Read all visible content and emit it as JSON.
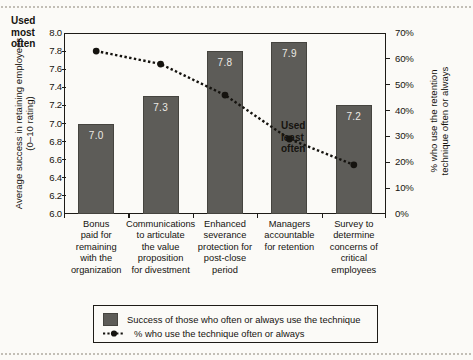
{
  "chart_data": {
    "type": "bar",
    "title": "",
    "subtitle": "",
    "categories": [
      "Bonus paid for remaining with the organization",
      "Communications to articulate the value proposition for divestment",
      "Enhanced severance protection for post-close period",
      "Managers accountable for retention",
      "Survey to determine concerns of critical employees"
    ],
    "category_lines": [
      [
        "Bonus",
        "paid for",
        "remaining",
        "with the",
        "organization"
      ],
      [
        "Communications",
        "to articulate",
        "the value",
        "proposition",
        "for divestment"
      ],
      [
        "Enhanced",
        "severance",
        "protection for",
        "post-close",
        "period"
      ],
      [
        "Managers",
        "accountable",
        "for retention"
      ],
      [
        "Survey to",
        "determine",
        "concerns of",
        "critical",
        "employees"
      ]
    ],
    "series": [
      {
        "name": "Success of those who often or always use the technique",
        "type": "bar",
        "axis": "left",
        "values": [
          7.0,
          7.3,
          7.8,
          7.9,
          7.2
        ],
        "labels": [
          "7.0",
          "7.3",
          "7.8",
          "7.9",
          "7.2"
        ],
        "color": "#5d5c58"
      },
      {
        "name": "% who use the technique often or always",
        "type": "line",
        "axis": "right",
        "values": [
          63,
          58,
          46,
          29,
          19
        ],
        "color": "#15130f",
        "style": "dotted-with-markers"
      }
    ],
    "xlabel": "",
    "ylabel_left_line1": "Average success in retaining employees",
    "ylabel_left_line2": "(0–10 rating)",
    "ylabel_right_line1": "% who use the retention",
    "ylabel_right_line2": "technique often or always",
    "ylim_left": [
      6.0,
      8.0
    ],
    "ylim_right": [
      0,
      70
    ],
    "yticks_left": [
      "6.0",
      "6.2",
      "6.4",
      "6.6",
      "6.8",
      "7.0",
      "7.2",
      "7.4",
      "7.6",
      "7.8",
      "8.0"
    ],
    "yticks_right": [
      "0%",
      "10%",
      "20%",
      "30%",
      "40%",
      "50%",
      "60%",
      "70%"
    ],
    "grid": false,
    "legend_position": "bottom"
  },
  "annotations": {
    "most": [
      "Used",
      "most",
      "often"
    ],
    "least": [
      "Used",
      "least",
      "often"
    ]
  },
  "legend": {
    "items": [
      {
        "label": "Success of those who often or always use the technique",
        "key": "swatch"
      },
      {
        "label": "% who use the technique often or always",
        "key": "dotted-line-marker"
      }
    ]
  }
}
